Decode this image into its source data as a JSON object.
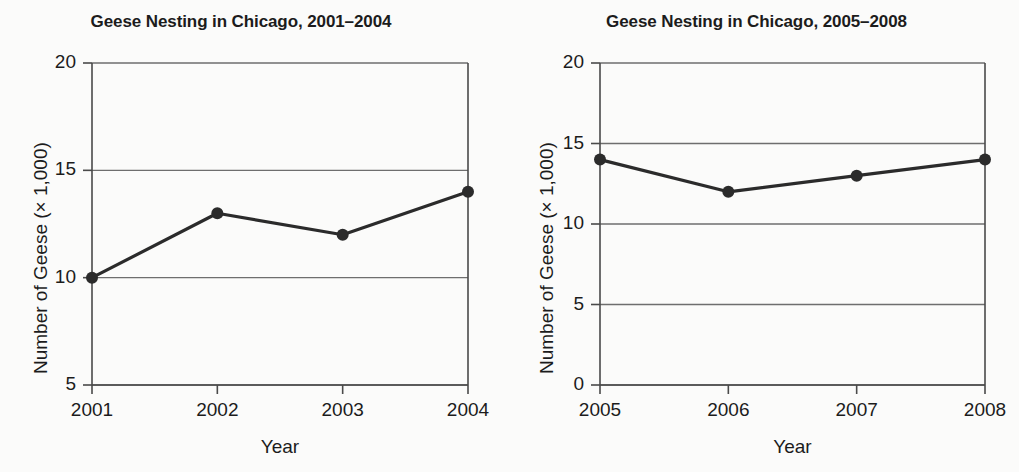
{
  "page": {
    "background_color": "#fbfbfa",
    "line_color": "#2b2b2b",
    "grid_color": "#6e6e6e",
    "axis_color": "#4a4a4a"
  },
  "chart_data": [
    {
      "type": "line",
      "title": "Geese Nesting in Chicago, 2001–2004",
      "xlabel": "Year",
      "ylabel": "Number of Geese (× 1,000)",
      "categories": [
        "2001",
        "2002",
        "2003",
        "2004"
      ],
      "values": [
        10,
        13,
        12,
        14
      ],
      "yticks": [
        "5",
        "10",
        "15",
        "20"
      ],
      "ytick_values": [
        5,
        10,
        15,
        20
      ],
      "ylim": [
        5,
        20
      ],
      "grid": "horizontal",
      "legend": "none",
      "markers": "filled-circle"
    },
    {
      "type": "line",
      "title": "Geese Nesting in Chicago, 2005–2008",
      "xlabel": "Year",
      "ylabel": "Number of Geese (× 1,000)",
      "categories": [
        "2005",
        "2006",
        "2007",
        "2008"
      ],
      "values": [
        14,
        12,
        13,
        14
      ],
      "yticks": [
        "0",
        "5",
        "10",
        "15",
        "20"
      ],
      "ytick_values": [
        0,
        5,
        10,
        15,
        20
      ],
      "ylim": [
        0,
        20
      ],
      "grid": "horizontal",
      "legend": "none",
      "markers": "filled-circle"
    }
  ]
}
